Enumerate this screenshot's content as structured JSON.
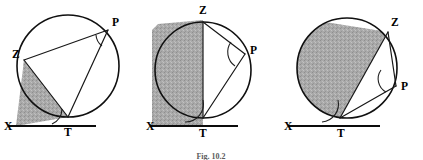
{
  "figure": {
    "caption": "Fig. 10.2",
    "background_color": "#ffffff",
    "ink_color": "#101010",
    "shade_color": "#a8a8a8"
  },
  "panels": [
    {
      "id": "panel-1",
      "name": "circle-tangent-diagram-1",
      "labels": {
        "x": "X",
        "t": "T",
        "z": "Z",
        "p": "P"
      },
      "description": "Circle with tangent XT at T, chord ZT, chord ZP and chord PT; shaded alternate segment at lower left.",
      "shaded_region": "minor-segment-ZT-with-tangent-wedge",
      "angle_marks": [
        "angle-at-T-between-TX-and-TZ",
        "angle-at-P-between-PZ-and-PT"
      ]
    },
    {
      "id": "panel-2",
      "name": "circle-tangent-diagram-2",
      "labels": {
        "x": "X",
        "t": "T",
        "z": "Z",
        "p": "P"
      },
      "description": "Circle with tangent XT at T, vertical diameter ZT, chords ZP and PT; shaded half-disc left of ZT.",
      "shaded_region": "major-segment-left-of-diameter-ZT",
      "angle_marks": [
        "angle-at-T-between-TX-and-TZ",
        "angle-at-P-between-PZ-and-PT"
      ]
    },
    {
      "id": "panel-3",
      "name": "circle-tangent-diagram-3",
      "labels": {
        "x": "X",
        "t": "T",
        "z": "Z",
        "p": "P"
      },
      "description": "Circle with tangent XT at T, chord ZT, chords ZP and PT; shaded major segment left of chord ZT.",
      "shaded_region": "major-segment-left-of-chord-ZT",
      "angle_marks": [
        "angle-at-T-between-TX-and-TZ",
        "angle-at-P-between-PZ-and-PT"
      ]
    }
  ],
  "geometry": {
    "panel1": {
      "circle": {
        "cx": 68,
        "cy": 66,
        "r": 51
      },
      "points": {
        "X": [
          10,
          126
        ],
        "T": [
          68,
          117
        ],
        "Z": [
          24,
          60
        ],
        "P": [
          108,
          30
        ]
      },
      "baseline": {
        "x1": 8,
        "y1": 126,
        "x2": 96,
        "y2": 126
      }
    },
    "panel2": {
      "circle": {
        "cx": 203,
        "cy": 70,
        "r": 48
      },
      "points": {
        "X": [
          152,
          126
        ],
        "T": [
          203,
          118
        ],
        "Z": [
          203,
          22
        ],
        "P": [
          245,
          54
        ]
      },
      "baseline": {
        "x1": 150,
        "y1": 126,
        "x2": 238,
        "y2": 126
      }
    },
    "panel3": {
      "circle": {
        "cx": 347,
        "cy": 68,
        "r": 50
      },
      "points": {
        "X": [
          290,
          126
        ],
        "T": [
          340,
          118
        ],
        "Z": [
          388,
          32
        ],
        "P": [
          396,
          86
        ]
      },
      "baseline": {
        "x1": 288,
        "y1": 126,
        "x2": 380,
        "y2": 126
      }
    }
  }
}
